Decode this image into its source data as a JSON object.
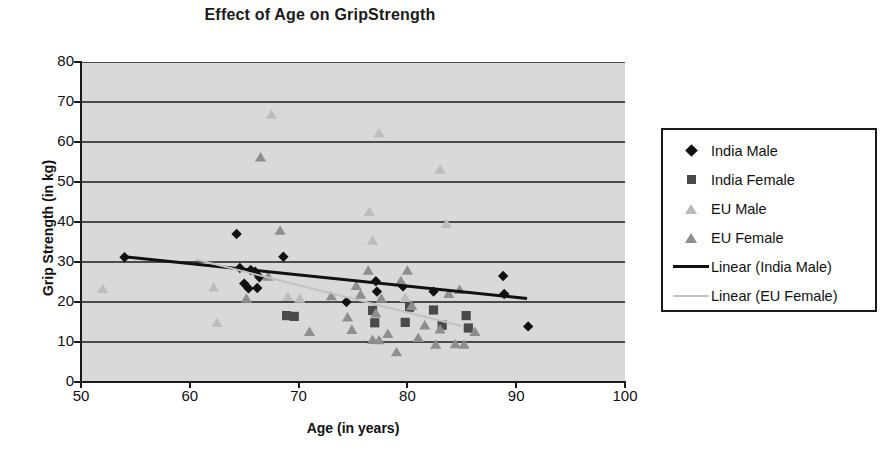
{
  "chart_data": {
    "type": "scatter",
    "title": "Effect of Age on GripStrength",
    "xlabel": "Age (in years)",
    "ylabel": "Grip Strength (in kg)",
    "xlim": [
      50,
      100
    ],
    "ylim": [
      0,
      80
    ],
    "xticks": [
      50,
      60,
      70,
      80,
      90,
      100
    ],
    "yticks": [
      0,
      10,
      20,
      30,
      40,
      50,
      60,
      70,
      80
    ],
    "grid": "horizontal",
    "plot_background": "#d9d9d9",
    "legend_position": "right",
    "series": [
      {
        "name": "India Male",
        "marker": "diamond",
        "color": "#111111",
        "points": [
          [
            54.0,
            31.2
          ],
          [
            64.3,
            37.0
          ],
          [
            64.6,
            28.5
          ],
          [
            65.0,
            24.6
          ],
          [
            65.4,
            23.4
          ],
          [
            66.2,
            23.5
          ],
          [
            66.0,
            27.6
          ],
          [
            66.4,
            26.2
          ],
          [
            68.6,
            31.3
          ],
          [
            65.6,
            28.0
          ],
          [
            74.4,
            20.0
          ],
          [
            77.1,
            25.2
          ],
          [
            77.2,
            22.6
          ],
          [
            79.6,
            23.9
          ],
          [
            82.4,
            22.6
          ],
          [
            88.8,
            26.5
          ],
          [
            88.9,
            22.0
          ],
          [
            91.1,
            13.9
          ]
        ]
      },
      {
        "name": "India Female",
        "marker": "square",
        "color": "#4a4a4a",
        "points": [
          [
            68.9,
            16.6
          ],
          [
            69.6,
            16.4
          ],
          [
            76.8,
            17.9
          ],
          [
            77.0,
            14.8
          ],
          [
            79.8,
            14.9
          ],
          [
            80.2,
            18.7
          ],
          [
            82.4,
            18.0
          ],
          [
            83.2,
            14.2
          ],
          [
            85.4,
            16.6
          ],
          [
            85.6,
            13.5
          ]
        ]
      },
      {
        "name": "EU Male",
        "marker": "triangle",
        "color": "#bdbdbd",
        "points": [
          [
            52.0,
            23.4
          ],
          [
            62.2,
            23.8
          ],
          [
            62.5,
            14.9
          ],
          [
            67.5,
            67.0
          ],
          [
            69.0,
            21.4
          ],
          [
            70.1,
            21.0
          ],
          [
            76.8,
            35.5
          ],
          [
            77.4,
            62.3
          ],
          [
            79.8,
            21.2
          ],
          [
            83.0,
            53.2
          ],
          [
            83.6,
            39.7
          ],
          [
            76.5,
            42.7
          ]
        ]
      },
      {
        "name": "EU Female",
        "marker": "triangle",
        "color": "#8e8e8e",
        "points": [
          [
            66.5,
            56.3
          ],
          [
            68.3,
            38.0
          ],
          [
            67.2,
            26.5
          ],
          [
            65.2,
            21.0
          ],
          [
            74.5,
            16.3
          ],
          [
            74.9,
            13.2
          ],
          [
            75.3,
            24.2
          ],
          [
            75.7,
            22.0
          ],
          [
            76.4,
            28.0
          ],
          [
            76.8,
            10.7
          ],
          [
            77.1,
            17.3
          ],
          [
            77.4,
            10.6
          ],
          [
            77.6,
            21.0
          ],
          [
            78.2,
            12.2
          ],
          [
            79.0,
            7.6
          ],
          [
            79.4,
            25.4
          ],
          [
            80.0,
            28.0
          ],
          [
            80.4,
            19.2
          ],
          [
            81.0,
            11.2
          ],
          [
            81.6,
            14.3
          ],
          [
            82.6,
            9.5
          ],
          [
            83.0,
            13.3
          ],
          [
            83.8,
            22.2
          ],
          [
            84.4,
            9.6
          ],
          [
            84.8,
            23.2
          ],
          [
            85.2,
            9.5
          ],
          [
            86.2,
            12.7
          ],
          [
            71.0,
            12.7
          ],
          [
            73.0,
            21.6
          ]
        ]
      }
    ],
    "trendlines": [
      {
        "name": "Linear (India Male)",
        "color": "#111111",
        "width": 3,
        "x0": 54.0,
        "y0": 31.3,
        "x1": 91.0,
        "y1": 20.9
      },
      {
        "name": "Linear (EU Female)",
        "color": "#c2c2c2",
        "width": 2,
        "x0": 60.5,
        "y0": 30.7,
        "x1": 85.0,
        "y1": 14.0
      }
    ]
  },
  "axis": {
    "y_title": "Grip Strength (in kg)",
    "x_title": "Age (in years)",
    "yticks": [
      "80",
      "70",
      "60",
      "50",
      "40",
      "30",
      "20",
      "10",
      "0"
    ],
    "xticks": [
      "50",
      "60",
      "70",
      "80",
      "90",
      "100"
    ]
  },
  "legend": {
    "items": [
      {
        "label": "India Male",
        "key": "diamond"
      },
      {
        "label": "India Female",
        "key": "square"
      },
      {
        "label": "EU Male",
        "key": "triangle-light"
      },
      {
        "label": "EU Female",
        "key": "triangle-mid"
      },
      {
        "label": "Linear (India Male)",
        "key": "line-black"
      },
      {
        "label": "Linear (EU Female)",
        "key": "line-gray"
      }
    ]
  }
}
